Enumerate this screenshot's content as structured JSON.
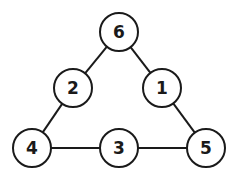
{
  "diagram": {
    "type": "number-triangle",
    "stroke_color": "#1a1a1a",
    "node_fill": "#ffffff",
    "node_radius": 19,
    "nodes": [
      {
        "id": "top",
        "label": "6",
        "x": 119,
        "y": 32
      },
      {
        "id": "left-mid",
        "label": "2",
        "x": 73,
        "y": 88
      },
      {
        "id": "right-mid",
        "label": "1",
        "x": 162,
        "y": 88
      },
      {
        "id": "bottom-left",
        "label": "4",
        "x": 32,
        "y": 148
      },
      {
        "id": "bottom-mid",
        "label": "3",
        "x": 119,
        "y": 148
      },
      {
        "id": "bottom-right",
        "label": "5",
        "x": 206,
        "y": 148
      }
    ],
    "edges": [
      {
        "from": "top",
        "to": "left-mid"
      },
      {
        "from": "top",
        "to": "right-mid"
      },
      {
        "from": "left-mid",
        "to": "bottom-left"
      },
      {
        "from": "right-mid",
        "to": "bottom-right"
      },
      {
        "from": "bottom-left",
        "to": "bottom-mid"
      },
      {
        "from": "bottom-mid",
        "to": "bottom-right"
      }
    ]
  }
}
